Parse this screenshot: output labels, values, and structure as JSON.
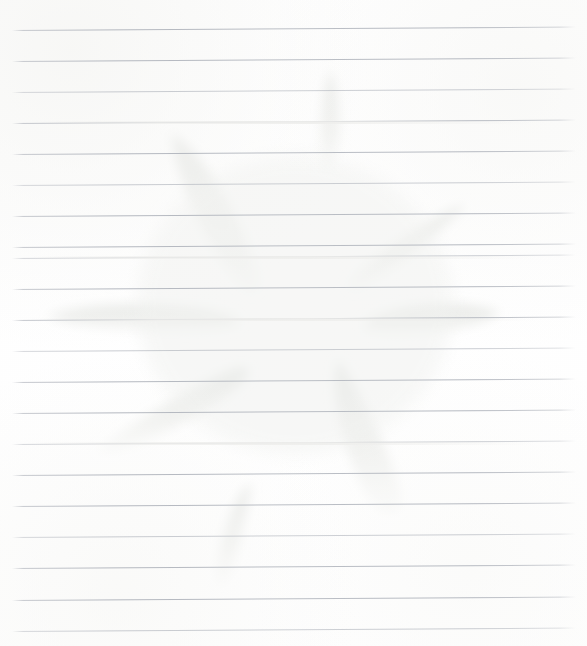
{
  "document": {
    "kind": "scanned-lined-paper",
    "title": "",
    "visible_text": "",
    "background_color": "#ffffff",
    "paper_tint": "#fefefe"
  },
  "ruling": {
    "line_color": "#b2b6be",
    "line_count": 20,
    "spacing_px": 31,
    "first_line_y": 30,
    "left_x": 12,
    "right_x": 576,
    "skew_deg": -0.35,
    "lines_y": [
      30,
      61,
      92,
      123,
      154,
      185,
      216,
      247,
      258,
      289,
      320,
      351,
      382,
      413,
      444,
      475,
      506,
      537,
      568,
      600,
      631
    ]
  },
  "artwork": {
    "name": "faint-flower-imprint",
    "description": "very pale eight-petal flower / starburst imprint bleeding through the page",
    "ink_color": "#e9eae8",
    "center": {
      "x": 295,
      "y": 305
    },
    "petal_count": 8,
    "petals": [
      {
        "id": "petal-top",
        "angle_deg": -82,
        "tip": {
          "x": 332,
          "y": 72
        },
        "length": 104,
        "width": 20
      },
      {
        "id": "petal-upper-left",
        "angle_deg": -118,
        "tip": {
          "x": 170,
          "y": 136
        },
        "length": 180,
        "width": 44
      },
      {
        "id": "petal-upper-right",
        "angle_deg": -38,
        "tip": {
          "x": 466,
          "y": 205
        },
        "length": 140,
        "width": 36
      },
      {
        "id": "petal-left",
        "angle_deg": 178,
        "tip": {
          "x": 46,
          "y": 318
        },
        "length": 200,
        "width": 30
      },
      {
        "id": "petal-right",
        "angle_deg": 3,
        "tip": {
          "x": 500,
          "y": 318
        },
        "length": 150,
        "width": 32
      },
      {
        "id": "petal-lower-left",
        "angle_deg": 146,
        "tip": {
          "x": 95,
          "y": 452
        },
        "length": 175,
        "width": 40
      },
      {
        "id": "petal-lower-right",
        "angle_deg": 68,
        "tip": {
          "x": 398,
          "y": 508
        },
        "length": 175,
        "width": 46
      },
      {
        "id": "petal-bottom",
        "angle_deg": 100,
        "tip": {
          "x": 224,
          "y": 586
        },
        "length": 110,
        "width": 24
      }
    ]
  }
}
